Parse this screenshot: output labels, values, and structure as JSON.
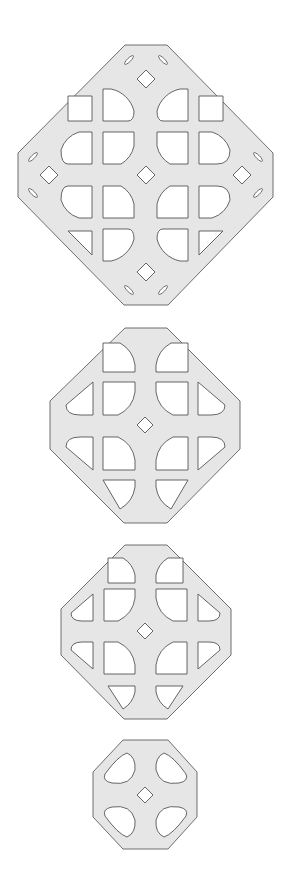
{
  "canvas": {
    "width": 288,
    "height": 881,
    "background": "#ffffff"
  },
  "colors": {
    "plate_fill": "#e6e6e6",
    "plate_stroke": "#6e6e6e",
    "hole_fill": "#ffffff",
    "hole_stroke": "#555555"
  },
  "shapes": [
    {
      "id": "large-grid-plate",
      "outline": "125,45 167,45 273,153 273,197 168,305 124,305 18,197 18,153",
      "diamonds": [
        [
          146,
          79,
          9
        ],
        [
          146,
          175,
          9
        ],
        [
          49,
          175,
          9
        ],
        [
          242,
          175,
          9
        ],
        [
          146,
          272,
          9
        ]
      ],
      "slots": [
        {
          "cx": 129,
          "cy": 60,
          "rx": 6,
          "ry": 1.8,
          "rot": -45
        },
        {
          "cx": 163,
          "cy": 60,
          "rx": 6,
          "ry": 1.8,
          "rot": 45
        },
        {
          "cx": 33,
          "cy": 157,
          "rx": 6,
          "ry": 1.8,
          "rot": -45
        },
        {
          "cx": 258,
          "cy": 157,
          "rx": 6,
          "ry": 1.8,
          "rot": 45
        },
        {
          "cx": 33,
          "cy": 193,
          "rx": 6,
          "ry": 1.8,
          "rot": 45
        },
        {
          "cx": 258,
          "cy": 193,
          "rx": 6,
          "ry": 1.8,
          "rot": -45
        },
        {
          "cx": 129,
          "cy": 290,
          "rx": 6,
          "ry": 1.8,
          "rot": 45
        },
        {
          "cx": 163,
          "cy": 290,
          "rx": 6,
          "ry": 1.8,
          "rot": -45
        }
      ],
      "holes": [
        "M68,96 L92,96 L92,121 L68,121 Z",
        "M103,89 L103,121 L128,121 Q134,121 134,111 A30,30 0 0 0 111,89 Z",
        "M188,89 L188,121 L163,121 Q157,121 157,111 A30,30 0 0 1 180,89 Z",
        "M223,96 L199,96 L199,121 L223,121 Z",
        "M92,132 L92,164 L68,164 Q61,164 61,150 A28,28 0 0 1 79,132 Z",
        "M103,132 L103,164 L121,164 A28,28 0 0 0 134,146 L134,132 Z",
        "M188,132 L188,164 L170,164 A28,28 0 0 1 157,146 L157,132 Z",
        "M199,132 L199,164 L217,164 Q230,164 230,150 A28,28 0 0 0 212,132 Z",
        "M92,218 L92,186 L68,186 Q61,186 61,200 A28,28 0 0 0 79,218 Z",
        "M103,218 L103,186 L121,186 A28,28 0 0 1 134,204 L134,218 Z",
        "M188,218 L188,186 L170,186 A28,28 0 0 0 157,204 L157,218 Z",
        "M199,218 L199,186 L217,186 Q230,186 230,200 A28,28 0 0 1 212,218 Z",
        "M68,231 L92,231 L92,255 Z",
        "M103,229 L103,261 L111,261 A30,30 0 0 0 134,239 Q134,229 128,229 Z",
        "M188,229 L188,261 L180,261 A30,30 0 0 1 157,239 Q157,229 163,229 Z",
        "M223,231 L199,231 L199,255 Z"
      ],
      "triangle_fixes": [
        "M92,96 L92,121 L68,121 Z",
        "M199,96 L199,121 L223,121 Z"
      ]
    },
    {
      "id": "medium-plate-a",
      "outline": "125,328 167,328 240,401 240,449 167,523 124,523 50,449 50,401",
      "diamonds": [
        [
          145,
          425,
          8
        ]
      ],
      "slots": [],
      "holes": [
        "M103,343 L103,372 L135,372 L135,365 A30,30 0 0 0 120,343 Z",
        "M188,343 L188,372 L156,372 L156,365 A30,30 0 0 1 171,343 Z",
        "M93,382 L93,415 L80,415 Q66,415 66,405 Z",
        "M103,382 L103,415 L118,415 A30,30 0 0 0 135,392 L135,382 Z",
        "M188,382 L188,415 L173,415 A30,30 0 0 1 156,392 L156,382 Z",
        "M198,382 L198,415 L211,415 Q225,415 225,405 Z",
        "M93,470 L93,437 L80,437 Q66,437 66,447 Z",
        "M103,470 L103,437 L118,437 A30,30 0 0 1 135,460 L135,470 Z",
        "M188,470 L188,437 L173,437 A30,30 0 0 0 156,460 L156,470 Z",
        "M198,470 L198,437 L211,437 Q225,437 225,447 Z",
        "M103,480 L135,480 L135,487 A30,30 0 0 1 120,509 Z",
        "M188,480 L156,480 L156,487 A30,30 0 0 0 171,509 Z"
      ]
    },
    {
      "id": "medium-plate-b",
      "outline": "125,545 167,545 231,609 231,655 167,719 124,719 61,655 61,609",
      "diamonds": [
        [
          145,
          631,
          8
        ]
      ],
      "slots": [],
      "holes": [
        "M108,558 L108,583 L135,583 L135,575 A26,26 0 0 0 123,558 Z",
        "M183,558 L183,583 L156,583 L156,575 A26,26 0 0 1 168,558 Z",
        "M93,594 L93,621 L82,621 Q71,621 71,613 Z",
        "M104,589 L104,621 L118,621 A30,30 0 0 0 135,598 L135,589 Z",
        "M187,589 L187,621 L173,621 A30,30 0 0 1 156,598 L156,589 Z",
        "M198,594 L198,621 L209,621 Q220,621 220,613 Z",
        "M93,669 L93,642 L82,642 Q71,642 71,650 Z",
        "M104,674 L104,642 L118,642 A30,30 0 0 1 135,665 L135,674 Z",
        "M187,674 L187,642 L173,642 A30,30 0 0 0 156,665 L156,674 Z",
        "M198,669 L198,642 L209,642 Q220,642 220,650 Z",
        "M108,686 L135,686 L135,692 A26,26 0 0 1 123,709 Z",
        "M183,686 L156,686 L156,692 A26,26 0 0 0 168,709 Z"
      ]
    },
    {
      "id": "small-plate",
      "outline": "123,740 168,740 197,772 197,817 168,849 123,849 93,817 93,772",
      "diamonds": [
        [
          145,
          795,
          8
        ]
      ],
      "slots": [],
      "holes": [
        "M127,753 Q118,756 105,774 Q102,781 112,783 Q131,786 135,770 Q136,757 127,753 Z",
        "M164,753 Q173,756 186,774 Q189,781 179,783 Q160,786 156,770 Q155,757 164,753 Z",
        "M127,837 Q118,834 105,816 Q102,809 112,807 Q131,804 135,820 Q136,833 127,837 Z",
        "M164,837 Q173,834 186,816 Q189,809 179,807 Q160,804 156,820 Q155,833 164,837 Z"
      ]
    }
  ]
}
